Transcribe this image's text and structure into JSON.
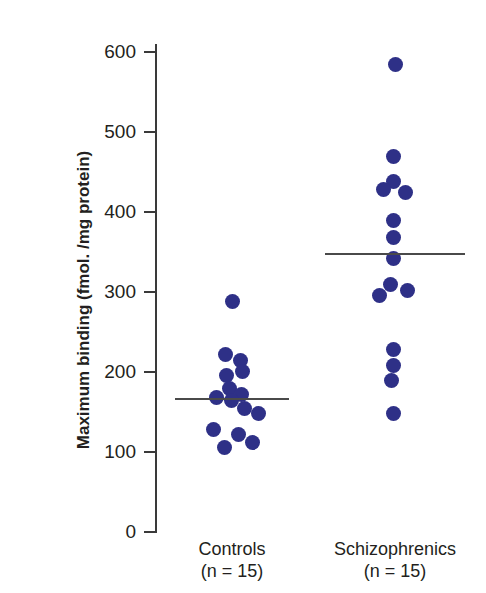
{
  "chart_data": {
    "type": "scatter",
    "title": "",
    "subtitle": "",
    "xlabel": "",
    "ylabel": "Maximum binding (fmol. /mg protein)",
    "ylim": [
      0,
      600
    ],
    "yticks": [
      0,
      100,
      200,
      300,
      400,
      500,
      600
    ],
    "ytick_labels": [
      "0",
      "100",
      "200",
      "300",
      "400",
      "500",
      "600"
    ],
    "grid": false,
    "legend": "none",
    "accent_color": "#2e3087",
    "axis_color": "#3a3a3a",
    "mean_line_color": "#4a4a4a",
    "categories": [
      "Controls",
      "Schizophrenics"
    ],
    "groups": [
      {
        "name": "Controls",
        "label_line1": "Controls",
        "label_line2": "(n = 15)",
        "n": 15,
        "mean": 166,
        "values": [
          288,
          222,
          214,
          201,
          196,
          180,
          172,
          168,
          164,
          155,
          148,
          128,
          122,
          112,
          106
        ],
        "points": [
          {
            "value": 288,
            "jitter": 0
          },
          {
            "value": 222,
            "jitter": -7
          },
          {
            "value": 214,
            "jitter": 8
          },
          {
            "value": 201,
            "jitter": 10
          },
          {
            "value": 196,
            "jitter": -6
          },
          {
            "value": 180,
            "jitter": -3
          },
          {
            "value": 172,
            "jitter": 9
          },
          {
            "value": 168,
            "jitter": -16
          },
          {
            "value": 164,
            "jitter": -1
          },
          {
            "value": 155,
            "jitter": 12
          },
          {
            "value": 148,
            "jitter": 26
          },
          {
            "value": 128,
            "jitter": -19
          },
          {
            "value": 122,
            "jitter": 6
          },
          {
            "value": 112,
            "jitter": 20
          },
          {
            "value": 106,
            "jitter": -8
          }
        ]
      },
      {
        "name": "Schizophrenics",
        "label_line1": "Schizophrenics",
        "label_line2": "(n = 15)",
        "n": 15,
        "mean": 347,
        "values": [
          584,
          470,
          438,
          425,
          425,
          390,
          368,
          347,
          337,
          304,
          301,
          296,
          228,
          208,
          190,
          148
        ],
        "points": [
          {
            "value": 584,
            "jitter": 0
          },
          {
            "value": 470,
            "jitter": -2
          },
          {
            "value": 438,
            "jitter": -2
          },
          {
            "value": 428,
            "jitter": -12
          },
          {
            "value": 425,
            "jitter": 10
          },
          {
            "value": 390,
            "jitter": -2
          },
          {
            "value": 368,
            "jitter": -2
          },
          {
            "value": 342,
            "jitter": -2
          },
          {
            "value": 310,
            "jitter": -5
          },
          {
            "value": 302,
            "jitter": 12
          },
          {
            "value": 296,
            "jitter": -16
          },
          {
            "value": 228,
            "jitter": -2
          },
          {
            "value": 208,
            "jitter": -2
          },
          {
            "value": 190,
            "jitter": -4
          },
          {
            "value": 148,
            "jitter": -2
          }
        ]
      }
    ]
  }
}
